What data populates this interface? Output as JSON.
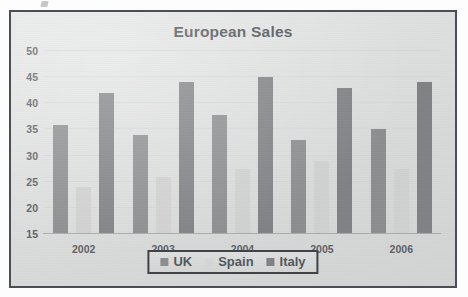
{
  "chart_data": {
    "type": "bar",
    "title": "European Sales",
    "xlabel": "",
    "ylabel": "",
    "categories": [
      "2002",
      "2003",
      "2004",
      "2005",
      "2006"
    ],
    "series": [
      {
        "name": "UK",
        "color": "#8c8e90",
        "values": [
          35.8,
          34,
          37.8,
          33,
          35
        ]
      },
      {
        "name": "Spain",
        "color": "#cfd0cf",
        "values": [
          24,
          26,
          27.5,
          29,
          27.5
        ]
      },
      {
        "name": "Italy",
        "color": "#808285",
        "values": [
          42,
          44,
          45,
          43,
          44
        ]
      }
    ],
    "ylim": [
      15,
      50
    ],
    "yticks": [
      15,
      20,
      25,
      30,
      35,
      40,
      45,
      50
    ],
    "ytick_labels": [
      "15",
      "20",
      "25",
      "30",
      "35",
      "40",
      "45",
      "50"
    ],
    "grid": true,
    "legend_position": "bottom"
  },
  "legend": {
    "items": [
      {
        "label": "UK"
      },
      {
        "label": "Spain"
      },
      {
        "label": "Italy"
      }
    ]
  }
}
